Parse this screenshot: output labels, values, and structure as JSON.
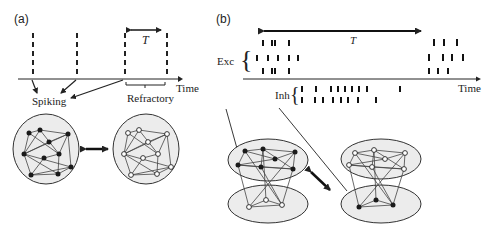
{
  "panel_a": {
    "label": "(a)",
    "period_label": "T",
    "axis_label": "Time",
    "spiking_label": "Spiking",
    "refractory_label": "Refractory",
    "spike_x": [
      33,
      77,
      125,
      167
    ]
  },
  "panel_b": {
    "label": "(b)",
    "period_label": "T",
    "axis_label": "Time",
    "exc_label": "Exc",
    "inh_label": "Inh"
  },
  "colors": {
    "line": "#222222",
    "cluster_fill": "#ebebeb",
    "active_node": "#1a1a1a",
    "inactive_node": "#ffffff"
  }
}
